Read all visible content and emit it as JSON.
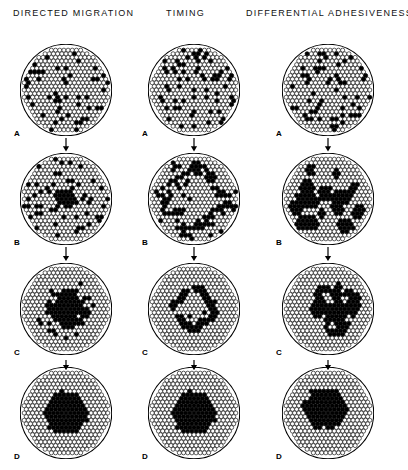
{
  "figure": {
    "width": 408,
    "height": 470,
    "ink_color": "#000000",
    "background": "#ffffff",
    "cell_fill_light": "#ffffff",
    "cell_fill_dark": "#000000",
    "cell_stroke": "#000000"
  },
  "columns": [
    {
      "id": "directed-migration",
      "title": "DIRECTED MIGRATION",
      "center_x": 66,
      "header_x": 13
    },
    {
      "id": "timing",
      "title": "TIMING",
      "center_x": 194,
      "header_x": 166
    },
    {
      "id": "differential-adhesiveness",
      "title": "DIFFERENTIAL ADHESIVENESS",
      "center_x": 328,
      "header_x": 246
    }
  ],
  "rows": [
    {
      "label": "A",
      "center_y": 90
    },
    {
      "label": "B",
      "center_y": 199
    },
    {
      "label": "C",
      "center_y": 309
    },
    {
      "label": "D",
      "center_y": 413
    }
  ],
  "arrows": [
    {
      "name": "arrow-a-to-b",
      "after_row": "A"
    },
    {
      "name": "arrow-b-to-c",
      "after_row": "B"
    },
    {
      "name": "arrow-c-to-d",
      "after_row": "C"
    }
  ],
  "geometry": {
    "circle_radius_cells": 10.6,
    "cell_radius_px": 2.05,
    "cell_pitch_x": 4.18,
    "cell_pitch_y": 3.62,
    "circle_outline_width": 1.1
  },
  "panels": [
    {
      "column": "directed-migration",
      "row": "A",
      "name": "panel-directed-migration-a",
      "description": "uniform random scatter of dark cells among light cells",
      "pattern": {
        "type": "scatter",
        "density": 0.135,
        "seed": 1101
      }
    },
    {
      "column": "directed-migration",
      "row": "B",
      "name": "panel-directed-migration-b",
      "description": "small solid dark core at center with random scatter around",
      "pattern": {
        "type": "core-scatter",
        "core_radius": 2.3,
        "core_wobble": 0.45,
        "density": 0.145,
        "seed": 1202
      }
    },
    {
      "column": "directed-migration",
      "row": "C",
      "name": "panel-directed-migration-c",
      "description": "larger dark core with spiky radiating arms, cleared periphery",
      "pattern": {
        "type": "spiky-core",
        "core_radius": 3.3,
        "spike_amp": 2.0,
        "spike_count": 11,
        "ring_extra": 1.6,
        "clear_radius": 7.2,
        "density": 0.1,
        "seed": 1303
      }
    },
    {
      "column": "directed-migration",
      "row": "D",
      "name": "panel-directed-migration-d",
      "description": "single large solid dark mass centered, periphery all light",
      "pattern": {
        "type": "blob",
        "core_radius": 5.1,
        "core_wobble": 0.55,
        "seed": 1404
      }
    },
    {
      "column": "timing",
      "row": "A",
      "name": "panel-timing-a",
      "description": "uniform random scatter of dark cells among light cells",
      "pattern": {
        "type": "scatter",
        "density": 0.135,
        "seed": 2101
      }
    },
    {
      "column": "timing",
      "row": "B",
      "name": "panel-timing-b",
      "description": "dark cells condensing into a broad irregular ring band",
      "pattern": {
        "type": "ring",
        "ring_radius": 6.6,
        "ring_width": 2.9,
        "ring_wobble": 1.5,
        "band_density": 0.62,
        "density": 0.085,
        "seed": 2202
      }
    },
    {
      "column": "timing",
      "row": "C",
      "name": "panel-timing-c",
      "description": "thick solid dark annulus with hollow light center",
      "pattern": {
        "type": "ring",
        "ring_radius": 4.4,
        "ring_width": 1.9,
        "ring_wobble": 0.7,
        "band_density": 0.95,
        "density": 0.035,
        "inner_specks": 5,
        "clear_radius": 6.6,
        "seed": 2303
      }
    },
    {
      "column": "timing",
      "row": "D",
      "name": "panel-timing-d",
      "description": "single large solid dark mass centered, periphery all light",
      "pattern": {
        "type": "blob",
        "core_radius": 5.0,
        "core_wobble": 0.6,
        "seed": 2404
      }
    },
    {
      "column": "differential-adhesiveness",
      "row": "A",
      "name": "panel-differential-adhesiveness-a",
      "description": "uniform random scatter of dark cells among light cells",
      "pattern": {
        "type": "scatter",
        "density": 0.135,
        "seed": 3101
      }
    },
    {
      "column": "differential-adhesiveness",
      "row": "B",
      "name": "panel-differential-adhesiveness-b",
      "description": "many small multi-cell dark clumps distributed throughout",
      "pattern": {
        "type": "clumps",
        "clump_count": 19,
        "clump_radius": 1.35,
        "spread": 8.4,
        "seed": 3202
      }
    },
    {
      "column": "differential-adhesiveness",
      "row": "C",
      "name": "panel-differential-adhesiveness-c",
      "description": "fewer, larger dark clumps coalescing into a branching network",
      "pattern": {
        "type": "clumps",
        "clump_count": 8,
        "clump_radius": 2.5,
        "spread": 5.0,
        "holes": 6,
        "hole_radius": 0.95,
        "seed": 3303
      }
    },
    {
      "column": "differential-adhesiveness",
      "row": "D",
      "name": "panel-differential-adhesiveness-d",
      "description": "single large solid dark mass, offset slightly up-left",
      "pattern": {
        "type": "blob",
        "core_radius": 5.0,
        "core_wobble": 0.7,
        "offset_x": -0.7,
        "offset_y": -1.1,
        "seed": 3404
      }
    }
  ]
}
